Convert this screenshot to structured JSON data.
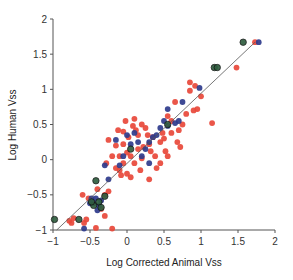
{
  "chart_data": {
    "type": "scatter",
    "title": "",
    "xlabel": "Log Corrected Animal Vss",
    "ylabel": "Log Human Vss",
    "xlim": [
      -1,
      2
    ],
    "ylim": [
      -1,
      2
    ],
    "xticks": [
      -1,
      -0.5,
      0,
      0.5,
      1,
      1.5,
      2
    ],
    "xtick_labels": [
      "−1",
      "−0.5",
      "0",
      "0.5",
      "1",
      "1.5",
      "2"
    ],
    "yticks": [
      -1,
      -0.5,
      0,
      0.5,
      1,
      1.5,
      2
    ],
    "ytick_labels": [
      "−1",
      "−0.5",
      "0",
      "0.5",
      "1",
      "1.5",
      "2"
    ],
    "grid": false,
    "legend": null,
    "reference_line": {
      "type": "unity",
      "from": [
        -0.95,
        -1.0
      ],
      "to": [
        1.73,
        1.67
      ],
      "color": "#555555"
    },
    "series": [
      {
        "name": "red",
        "color": "#e8483a",
        "points": [
          [
            -0.78,
            -0.87
          ],
          [
            -0.72,
            -0.83
          ],
          [
            -0.75,
            -0.9
          ],
          [
            -0.58,
            -0.9
          ],
          [
            -0.55,
            -0.85
          ],
          [
            -0.6,
            -0.5
          ],
          [
            -0.52,
            -0.55
          ],
          [
            -0.3,
            -0.5
          ],
          [
            -0.25,
            -0.45
          ],
          [
            -0.3,
            -0.8
          ],
          [
            -0.2,
            -0.98
          ],
          [
            -0.42,
            -0.97
          ],
          [
            -0.35,
            -0.7
          ],
          [
            -0.4,
            -0.42
          ],
          [
            -0.15,
            -0.12
          ],
          [
            -0.1,
            -0.15
          ],
          [
            -0.05,
            -0.05
          ],
          [
            -0.1,
            0.05
          ],
          [
            -0.2,
            0.05
          ],
          [
            -0.15,
            0.2
          ],
          [
            -0.05,
            0.22
          ],
          [
            0.0,
            0.1
          ],
          [
            0.05,
            0.05
          ],
          [
            0.1,
            -0.05
          ],
          [
            0.0,
            -0.2
          ],
          [
            -0.08,
            -0.22
          ],
          [
            0.05,
            -0.25
          ],
          [
            0.15,
            0.15
          ],
          [
            0.2,
            0.02
          ],
          [
            0.22,
            0.18
          ],
          [
            0.3,
            0.22
          ],
          [
            0.28,
            0.35
          ],
          [
            0.35,
            0.32
          ],
          [
            0.32,
            0.12
          ],
          [
            0.38,
            0.05
          ],
          [
            0.45,
            0.25
          ],
          [
            0.5,
            0.3
          ],
          [
            0.48,
            0.38
          ],
          [
            0.6,
            0.38
          ],
          [
            0.45,
            -0.05
          ],
          [
            0.4,
            -0.12
          ],
          [
            0.3,
            -0.28
          ],
          [
            0.25,
            0.45
          ],
          [
            0.1,
            0.58
          ],
          [
            -0.05,
            0.4
          ],
          [
            0.15,
            0.35
          ],
          [
            0.2,
            0.5
          ],
          [
            0.7,
            0.42
          ],
          [
            0.55,
            0.62
          ],
          [
            0.6,
            0.55
          ],
          [
            0.75,
            0.5
          ],
          [
            0.8,
            0.65
          ],
          [
            0.9,
            0.7
          ],
          [
            0.95,
            0.72
          ],
          [
            1.0,
            0.9
          ],
          [
            1.15,
            0.52
          ],
          [
            0.65,
            0.82
          ],
          [
            0.85,
            0.98
          ],
          [
            0.85,
            1.1
          ],
          [
            0.92,
            1.05
          ],
          [
            1.48,
            1.31
          ],
          [
            1.73,
            1.67
          ],
          [
            -0.02,
            0.55
          ],
          [
            0.08,
            0.48
          ],
          [
            0.12,
            0.42
          ],
          [
            -0.25,
            0.28
          ],
          [
            -0.28,
            -0.05
          ],
          [
            0.18,
            -0.15
          ],
          [
            0.55,
            0.05
          ],
          [
            0.68,
            0.25
          ],
          [
            0.72,
            0.18
          ],
          [
            0.52,
            0.12
          ],
          [
            0.02,
            0.32
          ],
          [
            -0.12,
            0.42
          ]
        ]
      },
      {
        "name": "blue",
        "color": "#2e3b8c",
        "points": [
          [
            -0.58,
            -0.98
          ],
          [
            -0.48,
            -0.55
          ],
          [
            -0.42,
            -0.55
          ],
          [
            -0.45,
            -0.62
          ],
          [
            -0.38,
            -0.65
          ],
          [
            -0.35,
            -0.58
          ],
          [
            -0.4,
            -0.72
          ],
          [
            -0.5,
            -0.62
          ],
          [
            -0.25,
            -0.28
          ],
          [
            -0.1,
            -0.08
          ],
          [
            -0.05,
            0.05
          ],
          [
            0.0,
            0.35
          ],
          [
            0.1,
            0.38
          ],
          [
            0.15,
            0.25
          ],
          [
            0.05,
            0.22
          ],
          [
            0.25,
            0.15
          ],
          [
            0.3,
            0.25
          ],
          [
            0.45,
            0.45
          ],
          [
            0.5,
            0.55
          ],
          [
            0.55,
            0.48
          ],
          [
            0.65,
            0.52
          ],
          [
            0.55,
            0.72
          ],
          [
            0.7,
            0.55
          ],
          [
            0.2,
            0.05
          ],
          [
            0.3,
            -0.05
          ],
          [
            -0.3,
            -0.08
          ],
          [
            0.75,
            0.82
          ],
          [
            0.98,
            1.02
          ],
          [
            1.78,
            1.67
          ],
          [
            0.4,
            0.35
          ],
          [
            -0.15,
            0.28
          ],
          [
            0.35,
            0.32
          ]
        ]
      },
      {
        "name": "green",
        "color": "#2f5e3f",
        "points": [
          [
            -0.98,
            -0.85
          ],
          [
            -0.65,
            -0.85
          ],
          [
            -0.45,
            -0.65
          ],
          [
            -0.38,
            -0.6
          ],
          [
            -0.35,
            -0.68
          ],
          [
            -0.48,
            -0.6
          ],
          [
            -0.3,
            -0.52
          ],
          [
            -0.42,
            -0.3
          ],
          [
            0.55,
            0.5
          ],
          [
            1.18,
            1.31
          ],
          [
            1.22,
            1.31
          ],
          [
            1.57,
            1.67
          ],
          [
            0.05,
            0.15
          ]
        ]
      }
    ]
  }
}
